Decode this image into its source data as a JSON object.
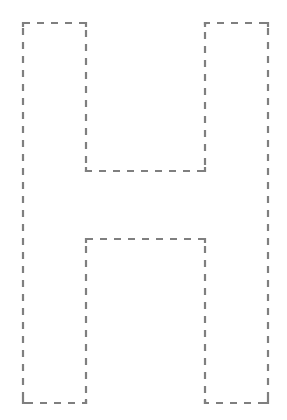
{
  "figure": {
    "letter": "H",
    "background": "#ffffff",
    "stroke_color": "#7f7f7f",
    "stroke_width": 2.2,
    "dash_pattern": "7 7",
    "outline_points": [
      [
        23,
        23
      ],
      [
        86,
        23
      ],
      [
        86,
        171
      ],
      [
        205,
        171
      ],
      [
        205,
        23
      ],
      [
        268,
        23
      ],
      [
        268,
        403
      ],
      [
        205,
        403
      ],
      [
        205,
        239
      ],
      [
        86,
        239
      ],
      [
        86,
        403
      ],
      [
        23,
        403
      ]
    ]
  }
}
